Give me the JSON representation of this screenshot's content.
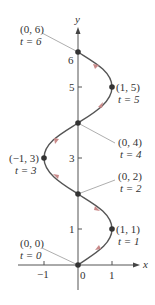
{
  "diagram": {
    "type": "parametric-curve",
    "axes": {
      "x_label": "x",
      "y_label": "y",
      "x_ticks": [
        {
          "value": -1,
          "label": "−1"
        },
        {
          "value": 0,
          "label": "0"
        },
        {
          "value": 1,
          "label": "1"
        }
      ],
      "y_ticks": [
        {
          "value": 1,
          "label": "1"
        },
        {
          "value": 2,
          "label": "2"
        },
        {
          "value": 3,
          "label": "3"
        },
        {
          "value": 4,
          "label": "4"
        },
        {
          "value": 5,
          "label": "5"
        },
        {
          "value": 6,
          "label": "6"
        }
      ]
    },
    "points": [
      {
        "coord": "(0, 0)",
        "t": "t = 0",
        "x": 0,
        "y": 0
      },
      {
        "coord": "(1, 1)",
        "t": "t = 1",
        "x": 1,
        "y": 1
      },
      {
        "coord": "(0, 2)",
        "t": "t = 2",
        "x": 0,
        "y": 2
      },
      {
        "coord": "(−1, 3)",
        "t": "t = 3",
        "x": -1,
        "y": 3
      },
      {
        "coord": "(0, 4)",
        "t": "t = 4",
        "x": 0,
        "y": 4
      },
      {
        "coord": "(1, 5)",
        "t": "t = 5",
        "x": 1,
        "y": 5
      },
      {
        "coord": "(0, 6)",
        "t": "t = 6",
        "x": 0,
        "y": 6
      }
    ],
    "colors": {
      "curve": "#555555",
      "arrow": "#c98a8a",
      "axis": "#555555",
      "point": "#333333",
      "leader": "#999999",
      "text": "#333333"
    }
  }
}
